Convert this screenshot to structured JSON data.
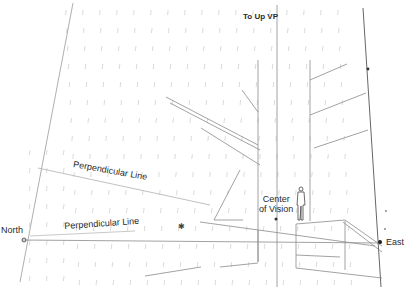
{
  "diagram": {
    "type": "two-point perspective grid sketch",
    "labels": {
      "up_vp": "To Up VP",
      "perp_line_1": "Perpendicular Line",
      "perp_line_2": "Perpendicular Line",
      "north": "North",
      "east": "East",
      "center_of_vision_1": "Center",
      "center_of_vision_2": "of Vision"
    },
    "right_edge_partial_marks": [
      "T",
      "t",
      "c",
      "t",
      "a",
      "s"
    ],
    "colors": {
      "background": "#ffffff",
      "grid_line": "#d6d6d6",
      "construction_line": "#8a8a8a",
      "strong_line": "#555555",
      "text": "#2a2a2a"
    }
  }
}
